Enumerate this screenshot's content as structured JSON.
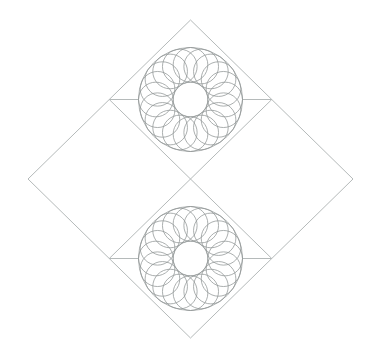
{
  "canvas": {
    "width": 372,
    "height": 357,
    "background": "#ffffff"
  },
  "figure": {
    "stroke": {
      "line_color": "#b5baba",
      "line_width": 1,
      "curve_color": "#8f9494",
      "curve_width": 0.75
    },
    "outer_diamond": {
      "vertices": [
        [
          190.5,
          20
        ],
        [
          353,
          179
        ],
        [
          190.5,
          338
        ],
        [
          28,
          179
        ]
      ]
    },
    "dividers": [
      [
        109.25,
        99.5,
        271.75,
        258.5
      ],
      [
        271.75,
        99.5,
        109.25,
        258.5
      ]
    ],
    "rosettes": [
      {
        "id": "top",
        "cx": 190.5,
        "cy": 99.5,
        "outer_radius": 52,
        "inner_radius": 17.33,
        "petal_count": 20,
        "petal_radius": 17.33,
        "petal_ring_radius": 34.67,
        "phase_deg": 90,
        "side_segments": [
          [
            109.25,
            99.5,
            138.5,
            99.5
          ],
          [
            242.5,
            99.5,
            271.75,
            99.5
          ]
        ]
      },
      {
        "id": "bottom",
        "cx": 190.5,
        "cy": 258.5,
        "outer_radius": 52,
        "inner_radius": 17.33,
        "petal_count": 20,
        "petal_radius": 17.33,
        "petal_ring_radius": 34.67,
        "phase_deg": 90,
        "side_segments": [
          [
            109.25,
            258.5,
            138.5,
            258.5
          ],
          [
            242.5,
            258.5,
            271.75,
            258.5
          ]
        ]
      }
    ]
  }
}
